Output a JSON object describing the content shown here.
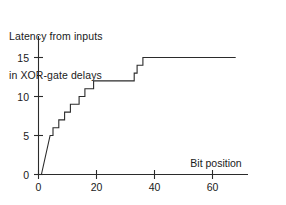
{
  "chart_data": {
    "type": "line",
    "title": "Latency from inputs in XOR-gate delays",
    "title_lines": [
      "Latency from inputs",
      "in XOR-gate delays"
    ],
    "xlabel": "Bit position",
    "ylabel": "",
    "xlim": [
      0,
      70
    ],
    "ylim": [
      0,
      16
    ],
    "grid": false,
    "legend": null,
    "xticks": [
      0,
      20,
      40,
      60
    ],
    "xtick_labels": [
      "0",
      "20",
      "40",
      "60"
    ],
    "yticks": [
      0,
      5,
      10,
      15
    ],
    "ytick_labels": [
      "0",
      "5",
      "10",
      "15"
    ],
    "series": [
      {
        "name": "latency",
        "style": "staircase",
        "x": [
          1,
          4,
          5,
          6,
          7,
          8,
          9,
          10,
          11,
          12,
          13,
          14,
          15,
          16,
          17,
          18,
          19,
          20,
          21,
          22,
          32,
          33,
          34,
          35,
          36,
          37,
          68
        ],
        "y": [
          0,
          5,
          5,
          6,
          6,
          7,
          7,
          8,
          8,
          9,
          9,
          10,
          10,
          11,
          11,
          11,
          12,
          12,
          12,
          12,
          12,
          13,
          13,
          14,
          14,
          15,
          15
        ],
        "points": [
          [
            1,
            0
          ],
          [
            4,
            5
          ],
          [
            5,
            5
          ],
          [
            5,
            6
          ],
          [
            7,
            6
          ],
          [
            7,
            7
          ],
          [
            9,
            7
          ],
          [
            9,
            8
          ],
          [
            11,
            8
          ],
          [
            11,
            9
          ],
          [
            14,
            9
          ],
          [
            14,
            10
          ],
          [
            16,
            10
          ],
          [
            16,
            11
          ],
          [
            19,
            11
          ],
          [
            19,
            12
          ],
          [
            33,
            12
          ],
          [
            33,
            13
          ],
          [
            34,
            13
          ],
          [
            34,
            14
          ],
          [
            36,
            14
          ],
          [
            36,
            15
          ],
          [
            68,
            15
          ]
        ]
      }
    ]
  },
  "axes": {
    "x_axis_name": "Bit position",
    "y_axis_name": ""
  }
}
